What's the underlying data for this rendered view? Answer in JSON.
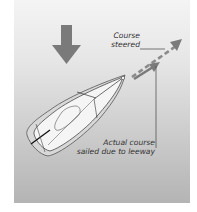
{
  "diagram": {
    "labels": {
      "course_steered_line1": "Course",
      "course_steered_line2": "steered",
      "actual_course_line1": "Actual course",
      "actual_course_line2": "sailed due to leeway"
    },
    "icons": {
      "wind_arrow": "wind-direction-arrow-down",
      "boat": "sailing-dinghy-top-view",
      "course_steered_arrow": "dashed-arrow",
      "actual_course_arrow": "solid-arrow"
    },
    "colors": {
      "arrow_gray": "#7a7a7a",
      "boat_hull": "#f2f2f2",
      "boat_outline": "#333333",
      "text": "#333333",
      "background_top": "#f4f4f4",
      "background_bottom": "#b4b4b4"
    }
  }
}
